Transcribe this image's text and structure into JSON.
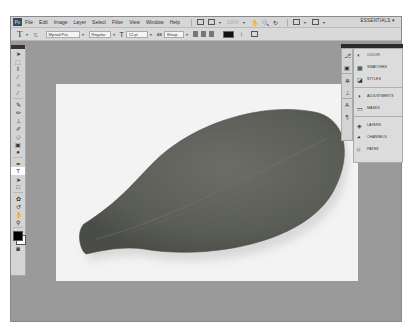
{
  "app": {
    "logo": "Ps"
  },
  "menubar": {
    "items": [
      "File",
      "Edit",
      "Image",
      "Layer",
      "Select",
      "Filter",
      "View",
      "Window",
      "Help"
    ],
    "zoom_level": "100%",
    "workspace": "ESSENTIALS"
  },
  "options_bar": {
    "tool_icon": "T",
    "font_family": "Myriad Pro",
    "font_style": "Regular",
    "font_size": "12 pt",
    "antialias": "Sharp",
    "text_color": "#111111"
  },
  "toolbox": {
    "tools": [
      "move",
      "marquee",
      "lasso",
      "quick-select",
      "crop",
      "eyedropper",
      "healing",
      "brush",
      "clone-stamp",
      "history-brush",
      "eraser",
      "gradient",
      "dodge",
      "pen",
      "type",
      "path-select",
      "shape",
      "3d-rotate",
      "3d-camera",
      "hand",
      "zoom"
    ],
    "selected_tool": "type",
    "foreground_color": "#000000",
    "background_color": "#ffffff"
  },
  "panels": {
    "groups": [
      [
        {
          "label": "COLOR",
          "icon": "color-icon"
        },
        {
          "label": "SWATCHES",
          "icon": "swatches-icon"
        },
        {
          "label": "STYLES",
          "icon": "styles-icon"
        }
      ],
      [
        {
          "label": "ADJUSTMENTS",
          "icon": "adjustments-icon"
        },
        {
          "label": "MASKS",
          "icon": "masks-icon"
        }
      ],
      [
        {
          "label": "LAYERS",
          "icon": "layers-icon"
        },
        {
          "label": "CHANNELS",
          "icon": "channels-icon"
        },
        {
          "label": "PATHS",
          "icon": "paths-icon"
        }
      ]
    ],
    "g0": [
      "COLOR",
      "SWATCHES",
      "STYLES"
    ],
    "g1": [
      "ADJUSTMENTS",
      "MASKS"
    ],
    "g2": [
      "LAYERS",
      "CHANNELS",
      "PATHS"
    ]
  },
  "document": {
    "content": "leaf photo on white background",
    "leaf_color": "#5c5e58"
  }
}
